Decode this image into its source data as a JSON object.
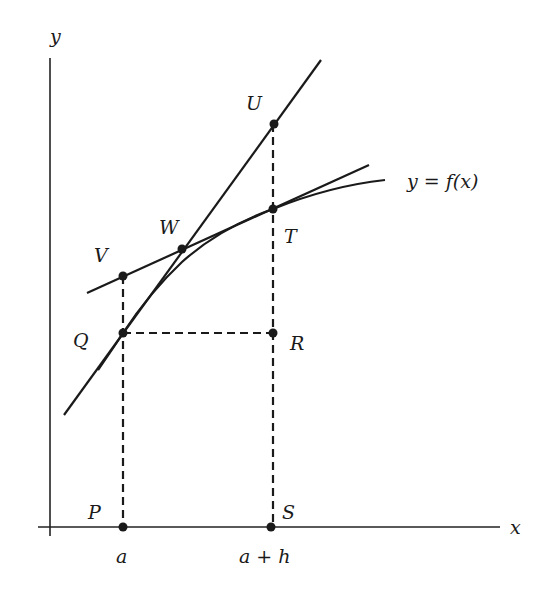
{
  "diagram": {
    "axes": {
      "x_label": "x",
      "y_label": "y"
    },
    "curve_label": "y = f(x)",
    "points": {
      "P": "P",
      "Q": "Q",
      "R": "R",
      "S": "S",
      "T": "T",
      "U": "U",
      "V": "V",
      "W": "W"
    },
    "tick_labels": {
      "a": "a",
      "a_plus_h": "a + h"
    },
    "colors": {
      "ink": "#1a1a1a",
      "background": "#ffffff"
    }
  }
}
